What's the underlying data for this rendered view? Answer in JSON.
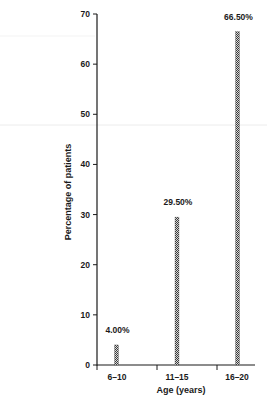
{
  "chart_data": {
    "type": "bar",
    "title": "",
    "xlabel": "Age (years)",
    "ylabel": "Percentage of patients",
    "categories": [
      "6–10",
      "11–15",
      "16–20"
    ],
    "values": [
      4.0,
      29.5,
      66.5
    ],
    "value_labels": [
      "4.00%",
      "29.50%",
      "66.50%"
    ],
    "ylim": [
      0,
      70
    ],
    "yticks": [
      0,
      10,
      20,
      30,
      40,
      50,
      60,
      70
    ],
    "grid": false,
    "legend": null,
    "bar_style": "narrow hatched bars",
    "colors": {
      "axis": "#1a1a1a",
      "bar_dark": "#3a3a3a",
      "bar_light": "#d8d8d8",
      "background": "#ffffff",
      "scan_line": "#ececec"
    }
  }
}
